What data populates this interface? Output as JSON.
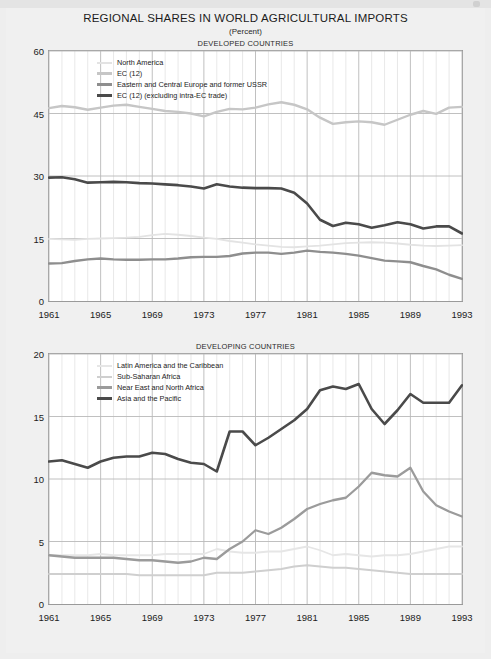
{
  "document": {
    "title": "REGIONAL SHARES IN WORLD AGRICULTURAL IMPORTS",
    "subtitle": "(Percent)"
  },
  "chart_data": [
    {
      "type": "line",
      "title": "DEVELOPED COUNTRIES",
      "xlabel": "",
      "ylabel": "",
      "xlim": [
        1961,
        1993
      ],
      "ylim": [
        0,
        60
      ],
      "yticks": [
        0,
        15,
        30,
        45,
        60
      ],
      "xticks": [
        1961,
        1965,
        1969,
        1973,
        1977,
        1981,
        1985,
        1989,
        1993
      ],
      "grid": true,
      "legend_position": "inside-top-left",
      "x": [
        1961,
        1962,
        1963,
        1964,
        1965,
        1966,
        1967,
        1968,
        1969,
        1970,
        1971,
        1972,
        1973,
        1974,
        1975,
        1976,
        1977,
        1978,
        1979,
        1980,
        1981,
        1982,
        1983,
        1984,
        1985,
        1986,
        1987,
        1988,
        1989,
        1990,
        1991,
        1992,
        1993
      ],
      "series": [
        {
          "name": "North America",
          "color": "#e3e3e3",
          "width": 1.8,
          "values": [
            14.9,
            14.8,
            14.7,
            14.9,
            15.0,
            15.1,
            15.2,
            15.4,
            15.8,
            16.1,
            15.9,
            15.6,
            15.2,
            14.9,
            14.4,
            14.0,
            13.6,
            13.3,
            13.0,
            12.9,
            13.1,
            13.3,
            13.6,
            13.9,
            14.0,
            14.1,
            14.0,
            13.8,
            13.5,
            13.3,
            13.2,
            13.3,
            13.4
          ]
        },
        {
          "name": "EC (12)",
          "color": "#c6c6c6",
          "width": 2.4,
          "values": [
            46.3,
            46.8,
            46.5,
            45.9,
            46.4,
            46.9,
            47.1,
            46.6,
            46.1,
            45.6,
            45.4,
            45.0,
            44.3,
            45.4,
            46.1,
            46.0,
            46.4,
            47.2,
            47.7,
            47.1,
            46.0,
            44.0,
            42.5,
            42.9,
            43.1,
            42.9,
            42.3,
            43.5,
            44.7,
            45.6,
            44.9,
            46.4,
            46.6
          ]
        },
        {
          "name": "Eastern and Central Europe and former USSR",
          "color": "#8e8e8e",
          "width": 2.4,
          "values": [
            9.0,
            9.1,
            9.6,
            10.0,
            10.2,
            10.0,
            9.9,
            9.9,
            10.0,
            10.0,
            10.2,
            10.5,
            10.6,
            10.6,
            10.8,
            11.4,
            11.6,
            11.6,
            11.3,
            11.6,
            12.1,
            11.8,
            11.6,
            11.3,
            10.9,
            10.3,
            9.7,
            9.5,
            9.3,
            8.4,
            7.6,
            6.3,
            5.3
          ]
        },
        {
          "name": "EC (12) (excluding intra-EC trade)",
          "color": "#4a4a4a",
          "width": 2.6,
          "values": [
            29.6,
            29.7,
            29.2,
            28.4,
            28.5,
            28.6,
            28.5,
            28.3,
            28.2,
            28.0,
            27.8,
            27.5,
            27.0,
            28.0,
            27.5,
            27.2,
            27.1,
            27.1,
            27.0,
            26.0,
            23.4,
            19.5,
            18.0,
            18.8,
            18.4,
            17.6,
            18.2,
            18.9,
            18.4,
            17.4,
            17.9,
            17.9,
            16.2
          ]
        }
      ]
    },
    {
      "type": "line",
      "title": "DEVELOPING COUNTRIES",
      "xlabel": "",
      "ylabel": "",
      "xlim": [
        1961,
        1993
      ],
      "ylim": [
        0,
        20
      ],
      "yticks": [
        0,
        5,
        10,
        15,
        20
      ],
      "xticks": [
        1961,
        1965,
        1969,
        1973,
        1977,
        1981,
        1985,
        1989,
        1993
      ],
      "grid": true,
      "legend_position": "inside-top-left",
      "x": [
        1961,
        1962,
        1963,
        1964,
        1965,
        1966,
        1967,
        1968,
        1969,
        1970,
        1971,
        1972,
        1973,
        1974,
        1975,
        1976,
        1977,
        1978,
        1979,
        1980,
        1981,
        1982,
        1983,
        1984,
        1985,
        1986,
        1987,
        1988,
        1989,
        1990,
        1991,
        1992,
        1993
      ],
      "series": [
        {
          "name": "Latin America and the Caribbean",
          "color": "#e6e6e6",
          "width": 1.8,
          "values": [
            3.9,
            3.9,
            3.9,
            3.9,
            4.0,
            3.9,
            3.9,
            3.9,
            3.9,
            4.0,
            4.0,
            4.0,
            4.0,
            4.4,
            4.2,
            4.1,
            4.1,
            4.2,
            4.2,
            4.4,
            4.6,
            4.3,
            3.9,
            4.0,
            3.9,
            3.8,
            3.9,
            3.9,
            4.0,
            4.2,
            4.4,
            4.6,
            4.6
          ]
        },
        {
          "name": "Sub-Saharan Africa",
          "color": "#cfcfcf",
          "width": 2.0,
          "values": [
            2.4,
            2.4,
            2.4,
            2.4,
            2.4,
            2.4,
            2.4,
            2.3,
            2.3,
            2.3,
            2.3,
            2.3,
            2.3,
            2.5,
            2.5,
            2.5,
            2.6,
            2.7,
            2.8,
            3.0,
            3.1,
            3.0,
            2.9,
            2.9,
            2.8,
            2.7,
            2.6,
            2.5,
            2.4,
            2.4,
            2.4,
            2.4,
            2.4
          ]
        },
        {
          "name": "Near East and North Africa",
          "color": "#9b9b9b",
          "width": 2.3,
          "values": [
            3.9,
            3.8,
            3.7,
            3.7,
            3.7,
            3.7,
            3.6,
            3.5,
            3.5,
            3.4,
            3.3,
            3.4,
            3.7,
            3.6,
            4.4,
            5.0,
            5.9,
            5.6,
            6.1,
            6.8,
            7.6,
            8.0,
            8.3,
            8.5,
            9.4,
            10.5,
            10.3,
            10.2,
            10.9,
            9.0,
            7.9,
            7.4,
            7.0
          ]
        },
        {
          "name": "Asia and the Pacific",
          "color": "#4a4a4a",
          "width": 2.6,
          "values": [
            11.4,
            11.5,
            11.2,
            10.9,
            11.4,
            11.7,
            11.8,
            11.8,
            12.1,
            12.0,
            11.6,
            11.3,
            11.2,
            10.6,
            13.8,
            13.8,
            12.7,
            13.3,
            14.0,
            14.7,
            15.6,
            17.1,
            17.4,
            17.2,
            17.6,
            15.6,
            14.4,
            15.5,
            16.8,
            16.1,
            16.1,
            16.1,
            17.5
          ]
        }
      ]
    }
  ]
}
